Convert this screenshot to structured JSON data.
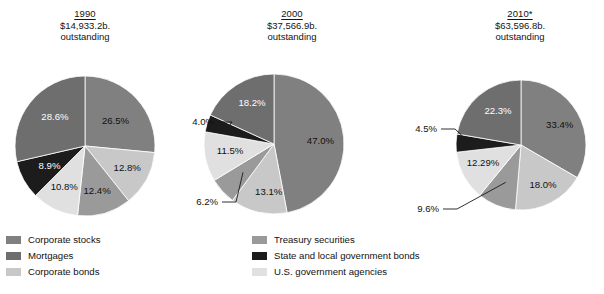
{
  "chart_data": {
    "type": "pie",
    "title": "",
    "legend_position": "bottom",
    "categories": [
      "Corporate stocks",
      "Treasury securities",
      "Mortgages",
      "State and local government bonds",
      "Corporate bonds",
      "U.S. government agencies"
    ],
    "colors": {
      "corporate_stocks": "#808080",
      "treasury_securities": "#9a9a9a",
      "mortgages": "#6e6e6e",
      "state_local_bonds": "#1c1c1c",
      "corporate_bonds": "#c8c8c8",
      "us_government_agencies": "#e0e0e0"
    },
    "charts": [
      {
        "year": "1990",
        "amount": "$14,933.2b.",
        "note": "outstanding",
        "slices": [
          {
            "label": "26.5%",
            "value": 26.5,
            "color": "#808080",
            "category": "Corporate stocks"
          },
          {
            "label": "12.8%",
            "value": 12.8,
            "color": "#c8c8c8",
            "category": "Corporate bonds"
          },
          {
            "label": "12.4%",
            "value": 12.4,
            "color": "#9a9a9a",
            "category": "Treasury securities"
          },
          {
            "label": "10.8%",
            "value": 10.8,
            "color": "#e0e0e0",
            "category": "U.S. government agencies"
          },
          {
            "label": "8.9%",
            "value": 8.9,
            "color": "#1c1c1c",
            "category": "State and local government bonds"
          },
          {
            "label": "28.6%",
            "value": 28.6,
            "color": "#6e6e6e",
            "category": "Mortgages"
          }
        ]
      },
      {
        "year": "2000",
        "amount": "$37,566.9b.",
        "note": "outstanding",
        "slices": [
          {
            "label": "47.0%",
            "value": 47.0,
            "color": "#808080",
            "category": "Corporate stocks"
          },
          {
            "label": "13.1%",
            "value": 13.1,
            "color": "#c8c8c8",
            "category": "Corporate bonds"
          },
          {
            "label": "6.2%",
            "value": 6.2,
            "color": "#9a9a9a",
            "category": "Treasury securities"
          },
          {
            "label": "11.5%",
            "value": 11.5,
            "color": "#e0e0e0",
            "category": "U.S. government agencies"
          },
          {
            "label": "4.0%",
            "value": 4.0,
            "color": "#1c1c1c",
            "category": "State and local government bonds"
          },
          {
            "label": "18.2%",
            "value": 18.2,
            "color": "#6e6e6e",
            "category": "Mortgages"
          }
        ]
      },
      {
        "year": "2010*",
        "amount": "$63,596.8b.",
        "note": "outstanding",
        "slices": [
          {
            "label": "33.4%",
            "value": 33.4,
            "color": "#808080",
            "category": "Corporate stocks"
          },
          {
            "label": "18.0%",
            "value": 18.0,
            "color": "#c8c8c8",
            "category": "Corporate bonds"
          },
          {
            "label": "9.6%",
            "value": 9.6,
            "color": "#9a9a9a",
            "category": "Treasury securities"
          },
          {
            "label": "12.29%",
            "value": 12.29,
            "color": "#e0e0e0",
            "category": "U.S. government agencies"
          },
          {
            "label": "4.5%",
            "value": 4.5,
            "color": "#1c1c1c",
            "category": "State and local government bonds"
          },
          {
            "label": "22.3%",
            "value": 22.3,
            "color": "#6e6e6e",
            "category": "Mortgages"
          }
        ]
      }
    ]
  },
  "headers": [
    {
      "year": "1990",
      "amount": "$14,933.2b.",
      "note": "outstanding"
    },
    {
      "year": "2000",
      "amount": "$37,566.9b.",
      "note": "outstanding"
    },
    {
      "year": "2010*",
      "amount": "$63,596.8b.",
      "note": "outstanding"
    }
  ],
  "legend": {
    "left": [
      {
        "label": "Corporate stocks",
        "color": "#808080"
      },
      {
        "label": "Mortgages",
        "color": "#6e6e6e"
      },
      {
        "label": "Corporate bonds",
        "color": "#c8c8c8"
      }
    ],
    "right": [
      {
        "label": "Treasury securities",
        "color": "#9a9a9a"
      },
      {
        "label": "State and local government bonds",
        "color": "#1c1c1c"
      },
      {
        "label": "U.S. government agencies",
        "color": "#e0e0e0"
      }
    ]
  }
}
